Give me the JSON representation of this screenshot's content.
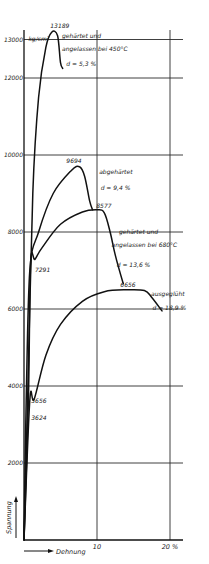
{
  "chart_data": {
    "type": "line",
    "title": "",
    "xlabel": "Dehnung",
    "ylabel": "Spannung",
    "unit_label": "kg/cm²",
    "xlim": [
      0,
      20
    ],
    "ylim": [
      0,
      13500
    ],
    "grid": true,
    "x_ticks": [
      {
        "value": 10,
        "label": "10"
      },
      {
        "value": 20,
        "label": "20 %"
      }
    ],
    "y_ticks": [
      {
        "value": 2000,
        "label": "2000"
      },
      {
        "value": 4000,
        "label": "4000"
      },
      {
        "value": 6000,
        "label": "6000"
      },
      {
        "value": 8000,
        "label": "8000"
      },
      {
        "value": 10000,
        "label": "10000"
      },
      {
        "value": 12000,
        "label": "12000"
      },
      {
        "value": 13000,
        "label": "13000"
      }
    ],
    "series": [
      {
        "name": "gehärtet und angelassen bei 450°C",
        "elongation_label": "d = 5,3 %",
        "peak_label": "13189",
        "points": [
          [
            0,
            0
          ],
          [
            0.5,
            3624
          ],
          [
            1.2,
            9000
          ],
          [
            2.0,
            11500
          ],
          [
            3.0,
            12800
          ],
          [
            3.8,
            13189
          ],
          [
            4.6,
            13100
          ],
          [
            5.0,
            12400
          ],
          [
            5.3,
            12250
          ]
        ]
      },
      {
        "name": "abgehärtet",
        "elongation_label": "d = 9,4 %",
        "peak_label": "9694",
        "points": [
          [
            0,
            0
          ],
          [
            0.3,
            3624
          ],
          [
            0.8,
            7000
          ],
          [
            2.0,
            8000
          ],
          [
            4.0,
            9000
          ],
          [
            6.5,
            9600
          ],
          [
            7.6,
            9694
          ],
          [
            8.3,
            9450
          ],
          [
            9.0,
            8800
          ],
          [
            9.4,
            8577
          ]
        ]
      },
      {
        "name": "gehärtet und angelassen bei 680°C",
        "elongation_label": "d = 13,6 %",
        "peak_label": "8577",
        "yield_label": "7291",
        "points": [
          [
            0,
            0
          ],
          [
            0.6,
            3624
          ],
          [
            0.9,
            7180
          ],
          [
            1.5,
            7291
          ],
          [
            2.5,
            7600
          ],
          [
            5.0,
            8200
          ],
          [
            8.0,
            8520
          ],
          [
            10.0,
            8577
          ],
          [
            11.0,
            8500
          ],
          [
            11.8,
            8000
          ],
          [
            12.5,
            7400
          ],
          [
            13.6,
            6656
          ]
        ]
      },
      {
        "name": "ausgeglüht",
        "elongation_label": "d = 18,9 %",
        "peak_label": "6656",
        "yield_labels": [
          "3656",
          "3624"
        ],
        "points": [
          [
            0,
            0
          ],
          [
            0.8,
            3624
          ],
          [
            1.4,
            3656
          ],
          [
            3.0,
            4800
          ],
          [
            5.0,
            5600
          ],
          [
            8.0,
            6200
          ],
          [
            11.0,
            6450
          ],
          [
            14.0,
            6500
          ],
          [
            16.5,
            6480
          ],
          [
            17.5,
            6300
          ],
          [
            18.9,
            5950
          ]
        ]
      }
    ],
    "annotations": [
      {
        "text": "13189",
        "x": 3.6,
        "y": 13300
      },
      {
        "text": "kg/cm²",
        "x": 0.6,
        "y": 12950
      },
      {
        "text": "gehärtet und",
        "x": 5.2,
        "y": 13050
      },
      {
        "text": "angelassen bei 450°C",
        "x": 5.2,
        "y": 12700
      },
      {
        "text": "d = 5,3 %",
        "x": 5.8,
        "y": 12300
      },
      {
        "text": "9694",
        "x": 5.8,
        "y": 9800
      },
      {
        "text": "abgehärtet",
        "x": 10.3,
        "y": 9500
      },
      {
        "text": "d = 9,4 %",
        "x": 10.5,
        "y": 9100
      },
      {
        "text": "8577",
        "x": 9.9,
        "y": 8620
      },
      {
        "text": "gehärtet und",
        "x": 13.0,
        "y": 7950
      },
      {
        "text": "angelassen bei 680°C",
        "x": 12.0,
        "y": 7600
      },
      {
        "text": "d = 13,6 %",
        "x": 12.7,
        "y": 7100
      },
      {
        "text": "7291",
        "x": 1.5,
        "y": 6950
      },
      {
        "text": "6656",
        "x": 13.2,
        "y": 6560
      },
      {
        "text": "ausgeglüht",
        "x": 17.4,
        "y": 6330
      },
      {
        "text": "d = 18,9 %",
        "x": 17.6,
        "y": 5980
      },
      {
        "text": "3656",
        "x": 1.0,
        "y": 3560
      },
      {
        "text": "3624",
        "x": 1.0,
        "y": 3120
      }
    ]
  },
  "layout": {
    "plot": {
      "x0": 24,
      "x_per_pct": 7.3,
      "y0": 540,
      "y_per_1000": 38.5,
      "top": 30,
      "right": 183
    }
  }
}
